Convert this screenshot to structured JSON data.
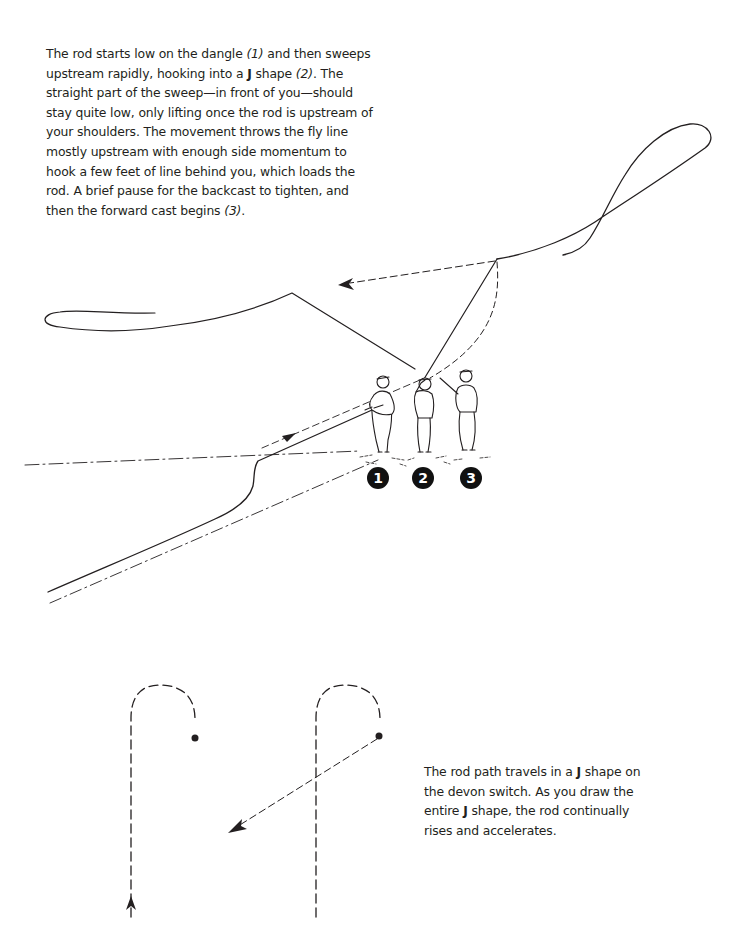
{
  "top_caption": {
    "segments": [
      {
        "text": "The rod starts low on the dangle ",
        "style": "normal"
      },
      {
        "text": "(1)",
        "style": "italic"
      },
      {
        "text": " and then sweeps upstream rapidly, hooking into a ",
        "style": "normal"
      },
      {
        "text": "J",
        "style": "bold"
      },
      {
        "text": " shape ",
        "style": "normal"
      },
      {
        "text": "(2)",
        "style": "italic"
      },
      {
        "text": ". The straight part of the sweep—in front of you—should stay quite low, only lifting once the rod is upstream of your shoulders. The movement throws the fly line mostly upstream with enough side momentum to hook a few feet of line behind you, which loads the rod. A brief pause for the backcast to tighten, and then the forward cast begins ",
        "style": "normal"
      },
      {
        "text": "(3)",
        "style": "italic"
      },
      {
        "text": ".",
        "style": "normal"
      }
    ]
  },
  "bottom_caption": {
    "segments": [
      {
        "text": "The rod path travels in a ",
        "style": "normal"
      },
      {
        "text": "J",
        "style": "bold"
      },
      {
        "text": " shape on the devon switch. As you draw the entire ",
        "style": "normal"
      },
      {
        "text": "J",
        "style": "bold"
      },
      {
        "text": " shape, the rod continually rises and accelerates.",
        "style": "normal"
      }
    ]
  },
  "figure": {
    "step_badges": [
      {
        "label": "1",
        "x": 377,
        "y": 467
      },
      {
        "label": "2",
        "x": 416,
        "y": 467
      },
      {
        "label": "3",
        "x": 470,
        "y": 467
      }
    ],
    "diagrams": [
      {
        "name": "j-shape-rod-path",
        "description": "J shape rod path with upward arrow"
      },
      {
        "name": "j-shape-with-forward-cast",
        "description": "J shape rod path with forward cast arrow"
      }
    ]
  },
  "colors": {
    "ink": "#231f20",
    "background": "#ffffff"
  }
}
